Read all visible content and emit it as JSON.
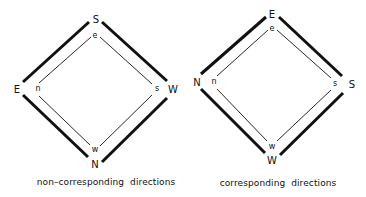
{
  "diagrams": [
    {
      "id": "non-corresponding",
      "caption": "non–corresponding directions",
      "outer": {
        "top": "S",
        "left": "E",
        "right": "W",
        "bottom": "N"
      },
      "inner": {
        "top": "e",
        "left": "n",
        "right": "s",
        "bottom": "w"
      }
    },
    {
      "id": "corresponding",
      "caption": "corresponding directions",
      "outer": {
        "top": "E",
        "left": "N",
        "right": "S",
        "bottom": "W"
      },
      "inner": {
        "top": "e",
        "left": "n",
        "right": "s",
        "bottom": "w"
      }
    }
  ],
  "colors": {
    "line": "#111111",
    "background": "#ffffff"
  }
}
